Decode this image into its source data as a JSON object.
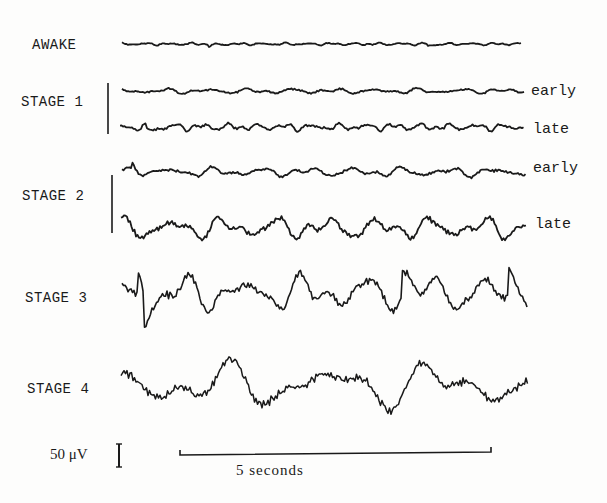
{
  "figure": {
    "rows": [
      {
        "id": "awake",
        "label": "AWAKE",
        "traces": [
          {
            "sublabel": "",
            "character": "low-amplitude fast (beta/alpha)",
            "amplitude": 0.18,
            "frequency": 1.0,
            "spikes": 0.2
          }
        ]
      },
      {
        "id": "stage1",
        "label": "STAGE 1",
        "traces": [
          {
            "sublabel": "early",
            "character": "low-amplitude mixed",
            "amplitude": 0.28,
            "frequency": 0.55,
            "spikes": 0.15
          },
          {
            "sublabel": "late",
            "character": "low-amplitude mixed, vertex sharp waves",
            "amplitude": 0.35,
            "frequency": 0.85,
            "spikes": 0.35
          }
        ]
      },
      {
        "id": "stage2",
        "label": "STAGE 2",
        "traces": [
          {
            "sublabel": "early",
            "character": "spindles and K-complexes",
            "amplitude": 0.4,
            "frequency": 0.5,
            "spikes": 0.3
          },
          {
            "sublabel": "late",
            "character": "K-complexes, more slow waves",
            "amplitude": 0.7,
            "frequency": 0.45,
            "spikes": 0.45
          }
        ]
      },
      {
        "id": "stage3",
        "label": "STAGE 3",
        "traces": [
          {
            "sublabel": "",
            "character": "20-50% delta waves",
            "amplitude": 0.9,
            "frequency": 0.38,
            "spikes": 0.4
          }
        ]
      },
      {
        "id": "stage4",
        "label": "STAGE 4",
        "traces": [
          {
            "sublabel": "",
            "character": ">50% high-amplitude delta waves",
            "amplitude": 1.0,
            "frequency": 0.22,
            "spikes": 0.2
          }
        ]
      }
    ],
    "scale": {
      "voltage_label": "50 μV",
      "voltage_value_uV": 50,
      "time_label": "5   seconds",
      "time_value_s": 5
    },
    "colors": {
      "ink": "#1a1a1a",
      "paper": "#fdfdfc"
    }
  }
}
